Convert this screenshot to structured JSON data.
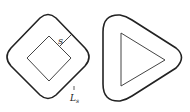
{
  "figure": {
    "left_shape": {
      "description": "square rotated 45 degrees with rounded offset boundary",
      "offset_label": "s",
      "boundary_label": "L",
      "boundary_subscript": "s"
    },
    "right_shape": {
      "description": "triangle with rounded offset boundary"
    },
    "colors": {
      "outer_stroke": "#222222",
      "inner_stroke": "#444444"
    }
  }
}
